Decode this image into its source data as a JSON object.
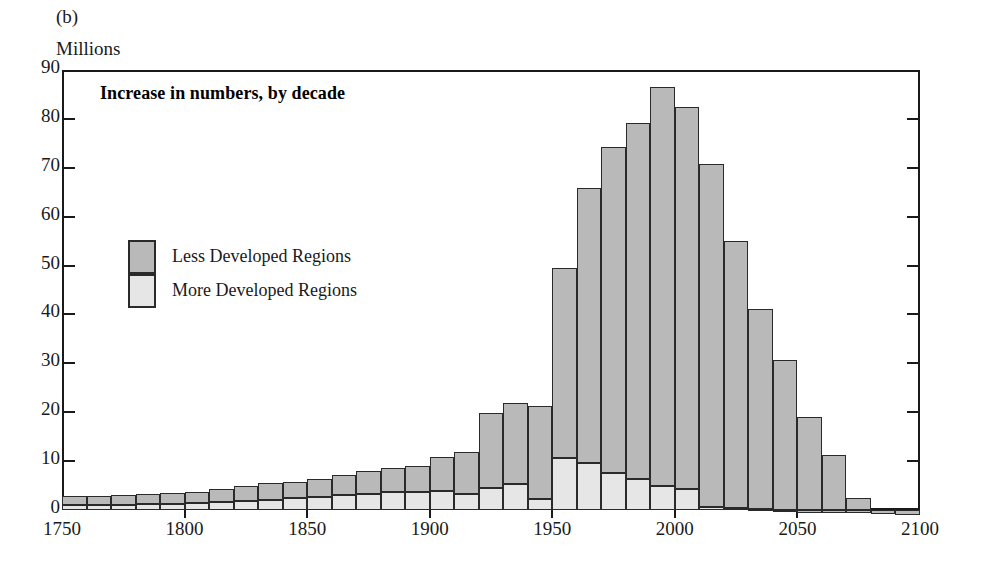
{
  "figure": {
    "panel_label": "(b)",
    "unit_caption": "Millions",
    "inner_title": "Increase in numbers, by decade"
  },
  "legend": {
    "position": "inside-upper-left",
    "entries": [
      {
        "key": "less",
        "label": "Less Developed Regions",
        "color": "#b9b9b9"
      },
      {
        "key": "more",
        "label": "More Developed Regions",
        "color": "#e6e6e6"
      }
    ]
  },
  "axes": {
    "y_ticks": [
      90,
      80,
      70,
      60,
      50,
      40,
      30,
      20,
      10,
      0
    ],
    "x_ticks": [
      1750,
      1800,
      1850,
      1900,
      1950,
      2000,
      2050,
      2100
    ]
  },
  "chart_data": {
    "type": "bar",
    "title": "Increase in numbers, by decade",
    "subtitle": "(b)",
    "xlabel": "",
    "ylabel": "Millions",
    "ylim": [
      -2,
      90
    ],
    "xlim": [
      1750,
      2100
    ],
    "grid": false,
    "stacked": true,
    "bar_step_years": 10,
    "legend_position": "inside-upper-left",
    "categories": [
      "1750",
      "1760",
      "1770",
      "1780",
      "1790",
      "1800",
      "1810",
      "1820",
      "1830",
      "1840",
      "1850",
      "1860",
      "1870",
      "1880",
      "1890",
      "1900",
      "1910",
      "1920",
      "1930",
      "1940",
      "1950",
      "1960",
      "1970",
      "1980",
      "1990",
      "2000",
      "2010",
      "2020",
      "2030",
      "2040",
      "2050",
      "2060",
      "2070",
      "2080",
      "2090"
    ],
    "series": [
      {
        "name": "More Developed Regions",
        "color": "#e6e6e6",
        "values": [
          1.0,
          1.0,
          1.1,
          1.2,
          1.3,
          1.4,
          1.6,
          1.8,
          2.1,
          2.4,
          2.7,
          3.0,
          3.3,
          3.6,
          3.6,
          3.9,
          3.3,
          4.4,
          5.3,
          2.2,
          10.7,
          9.7,
          7.5,
          6.3,
          5.0,
          4.2,
          0.6,
          0.5,
          0.3,
          0.1,
          -0.2,
          -0.3,
          -0.5,
          -0.8,
          -1.0
        ]
      },
      {
        "name": "Less Developed Regions",
        "color": "#b9b9b9",
        "values": [
          1.8,
          1.9,
          2.0,
          2.0,
          2.1,
          2.3,
          2.6,
          3.1,
          3.4,
          3.4,
          3.6,
          4.1,
          4.7,
          5.0,
          5.3,
          6.9,
          8.6,
          15.4,
          16.5,
          19.0,
          38.8,
          56.1,
          66.8,
          72.8,
          81.5,
          78.3,
          70.1,
          54.5,
          40.8,
          30.6,
          19.1,
          11.3,
          2.5,
          0.0,
          0.0
        ]
      }
    ],
    "totals": [
      2.8,
      2.9,
      3.1,
      3.2,
      3.4,
      3.7,
      4.2,
      4.9,
      5.5,
      5.8,
      6.3,
      7.1,
      8.0,
      8.6,
      8.9,
      10.8,
      11.9,
      19.8,
      21.8,
      21.2,
      49.5,
      65.8,
      74.3,
      79.1,
      86.5,
      85.8,
      82.5,
      70.8,
      55.0,
      41.2,
      30.7,
      19.2,
      11.2,
      2.5,
      -1.0
    ]
  }
}
